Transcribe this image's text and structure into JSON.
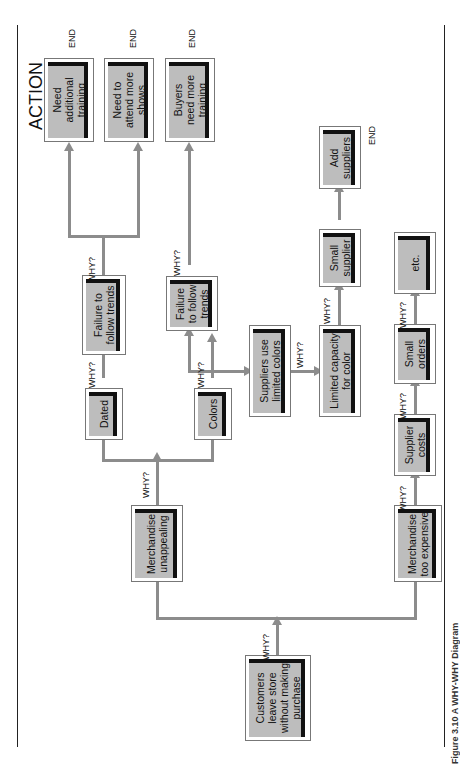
{
  "header": {
    "action_label": "ACTION"
  },
  "nodes": {
    "root": "Customers\nleave store\nwithout making\npurchase",
    "merch_unappealing": "Merchandise\nunappealing",
    "merch_expensive": "Merchandise\ntoo expensive",
    "dated": "Dated",
    "colors": "Colors",
    "failure_trends_1": "Failure to\nfollow trends",
    "failure_trends_2": "Failure\nto follow\ntrends",
    "suppliers_limited": "Suppliers use\nlimited colors",
    "limited_capacity": "Limited capacity\nfor color",
    "small_supplier": "Small\nsupplier",
    "add_suppliers": "Add\nsuppliers",
    "supplier_costs": "Supplier\ncosts",
    "small_orders": "Small\norders",
    "etc": "etc.",
    "need_training": "Need\nadditional\ntraining",
    "attend_shows": "Need to\nattend more\nshows",
    "buyers_training": "Buyers\nneed more\ntraining"
  },
  "labels": {
    "why": "WHY?",
    "end": "END"
  },
  "caption": "Figure 3.10  A WHY-WHY Diagram"
}
